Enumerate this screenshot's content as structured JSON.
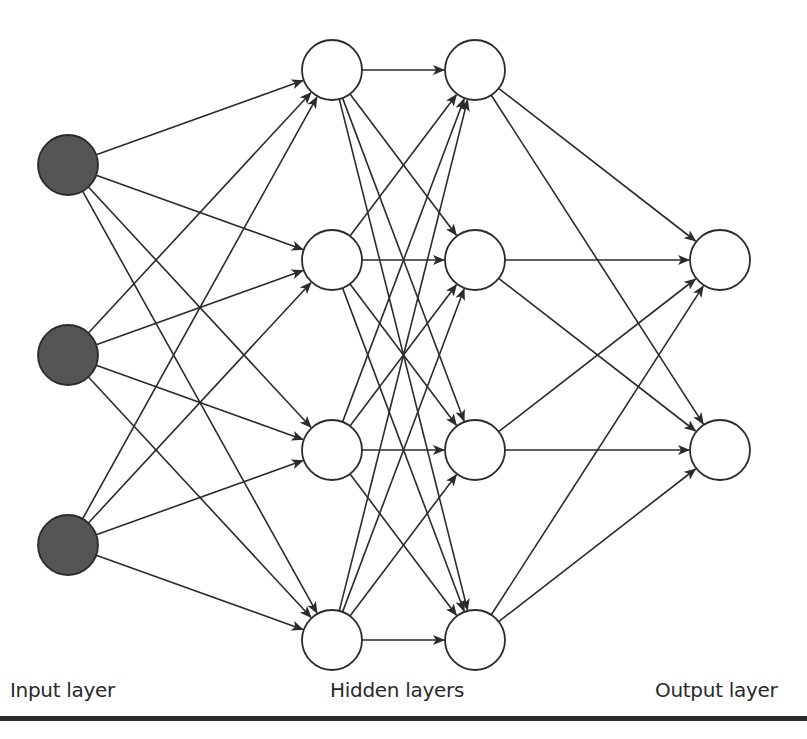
{
  "diagram": {
    "labels": {
      "input": "Input layer",
      "hidden": "Hidden layers",
      "output": "Output layer"
    },
    "colors": {
      "input_fill": "#555555",
      "node_fill": "#ffffff",
      "stroke": "#2b2b2b",
      "edge": "#2b2b2b"
    },
    "node_radius": 30,
    "layers": [
      {
        "name": "input",
        "x": 68,
        "ys": [
          165,
          355,
          545
        ],
        "filled": true
      },
      {
        "name": "hidden1",
        "x": 332,
        "ys": [
          70,
          260,
          450,
          640
        ],
        "filled": false
      },
      {
        "name": "hidden2",
        "x": 475,
        "ys": [
          70,
          260,
          450,
          640
        ],
        "filled": false
      },
      {
        "name": "output",
        "x": 720,
        "ys": [
          260,
          450
        ],
        "filled": false
      }
    ],
    "connectivity": "fully-connected-adjacent-layers"
  }
}
